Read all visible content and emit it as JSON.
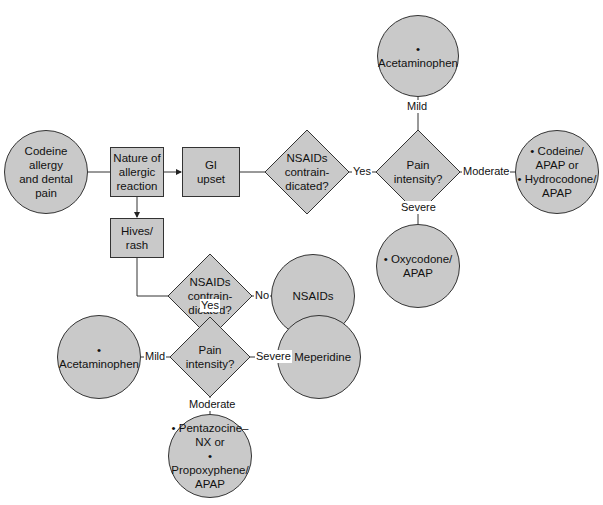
{
  "diagram": {
    "start": {
      "lines": [
        "Codeine",
        "allergy",
        "and dental",
        "pain"
      ]
    },
    "nature": {
      "lines": [
        "Nature of",
        "allergic",
        "reaction"
      ]
    },
    "gi_upset": {
      "lines": [
        "GI",
        "upset"
      ]
    },
    "hives": {
      "lines": [
        "Hives/",
        "rash"
      ]
    },
    "nsaids_q1": {
      "lines": [
        "NSAIDs",
        "contrain-",
        "dicated?"
      ]
    },
    "pain_q1": {
      "lines": [
        "Pain",
        "intensity?"
      ]
    },
    "acet_top": {
      "lines": [
        "• Acetaminophen"
      ]
    },
    "codeine_apap": {
      "lines": [
        "• Codeine/",
        "APAP or",
        "• Hydrocodone/",
        "APAP"
      ]
    },
    "oxycodone": {
      "lines": [
        "• Oxycodone/",
        "APAP"
      ]
    },
    "nsaids_q2": {
      "lines": [
        "NSAIDs",
        "contrain-",
        "dicated?"
      ]
    },
    "nsaids_result": {
      "lines": [
        "NSAIDs"
      ]
    },
    "pain_q2": {
      "lines": [
        "Pain",
        "intensity?"
      ]
    },
    "acet_bottom": {
      "lines": [
        "• Acetaminophen"
      ]
    },
    "meperidine": {
      "lines": [
        "• Meperidine"
      ]
    },
    "pentazocine": {
      "lines": [
        "• Pentazocine–",
        "NX or",
        "• Propoxyphene/",
        "APAP"
      ]
    },
    "edge_labels": {
      "yes1": "Yes",
      "mild1": "Mild",
      "moderate1": "Moderate",
      "severe1": "Severe",
      "no2": "No",
      "yes2": "Yes",
      "mild2": "Mild",
      "severe2": "Severe",
      "moderate2": "Moderate"
    },
    "colors": {
      "fill": "#c9c9c9",
      "stroke": "#333333"
    }
  }
}
